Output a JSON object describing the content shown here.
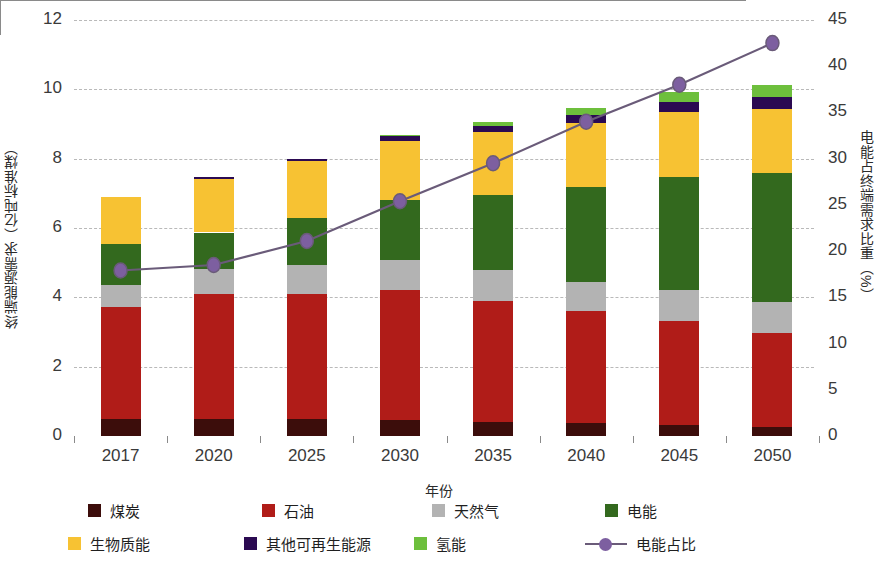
{
  "chart_data": {
    "type": "bar",
    "title": "",
    "xlabel": "年份",
    "ylabel": "终端能源需求（亿吨标准煤）",
    "ylabel_right": "电能占终端需求比重（%）",
    "categories": [
      "2017",
      "2020",
      "2025",
      "2030",
      "2035",
      "2040",
      "2045",
      "2050"
    ],
    "ylim": [
      0,
      12
    ],
    "yticks": [
      "0",
      "2",
      "4",
      "6",
      "8",
      "10",
      "12"
    ],
    "ylim_right": [
      0,
      45
    ],
    "yticks_right": [
      "0",
      "5",
      "10",
      "15",
      "20",
      "25",
      "30",
      "35",
      "40",
      "45"
    ],
    "grid": true,
    "legend_position": "bottom",
    "stacked": true,
    "series": [
      {
        "name": "煤炭",
        "color": "#3c0d0b",
        "values": [
          0.5,
          0.5,
          0.48,
          0.45,
          0.4,
          0.38,
          0.32,
          0.26
        ]
      },
      {
        "name": "石油",
        "color": "#b01c18",
        "values": [
          3.22,
          3.6,
          3.62,
          3.75,
          3.5,
          3.22,
          3.0,
          2.7
        ]
      },
      {
        "name": "天然气",
        "color": "#b3b3b3",
        "values": [
          0.65,
          0.72,
          0.82,
          0.88,
          0.88,
          0.85,
          0.88,
          0.9
        ]
      },
      {
        "name": "电能",
        "color": "#33691e",
        "values": [
          1.18,
          1.05,
          1.38,
          1.72,
          2.18,
          2.72,
          3.26,
          3.72
        ]
      },
      {
        "name": "生物质能",
        "color": "#f7c233",
        "values": [
          1.35,
          1.55,
          1.62,
          1.72,
          1.82,
          1.85,
          1.88,
          1.86
        ]
      },
      {
        "name": "其他可再生能源",
        "color": "#2b0a52",
        "values": [
          0.0,
          0.05,
          0.08,
          0.12,
          0.17,
          0.24,
          0.3,
          0.35
        ]
      },
      {
        "name": "氢能",
        "color": "#6dbf3c",
        "values": [
          0.0,
          0.0,
          0.0,
          0.04,
          0.12,
          0.2,
          0.27,
          0.33
        ]
      }
    ],
    "line_series": {
      "name": "电能占比",
      "color": "#6a5b79",
      "marker_color": "#7d5fa0",
      "axis": "right",
      "unit": "%",
      "values": [
        17.9,
        18.5,
        21.1,
        25.4,
        29.5,
        34.0,
        38.0,
        42.5
      ]
    }
  },
  "legend": {
    "row1": [
      {
        "label": "煤炭",
        "color": "#3c0d0b",
        "swatch": "square"
      },
      {
        "label": "石油",
        "color": "#b01c18",
        "swatch": "square"
      },
      {
        "label": "天然气",
        "color": "#b3b3b3",
        "swatch": "square"
      },
      {
        "label": "电能",
        "color": "#33691e",
        "swatch": "square"
      }
    ],
    "row2": [
      {
        "label": "生物质能",
        "color": "#f7c233",
        "swatch": "square"
      },
      {
        "label": "其他可再生能源",
        "color": "#2b0a52",
        "swatch": "square"
      },
      {
        "label": "氢能",
        "color": "#6dbf3c",
        "swatch": "square"
      },
      {
        "label": "电能占比",
        "color": "#6a5b79",
        "swatch": "line-marker"
      }
    ]
  }
}
